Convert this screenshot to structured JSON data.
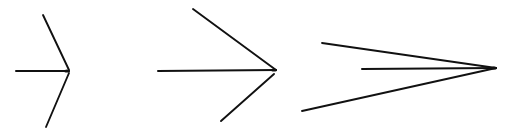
{
  "figure": {
    "stroke_color": "#111111",
    "background": "#ffffff",
    "arrows": [
      {
        "id": "arrow-1",
        "shaft": {
          "x1": 16,
          "y1": 71,
          "x2": 69,
          "y2": 71
        },
        "fin_upper": {
          "x1": 43,
          "y1": 15,
          "x2": 69,
          "y2": 70
        },
        "fin_lower": {
          "x1": 69,
          "y1": 73,
          "x2": 46,
          "y2": 127
        },
        "tip": {
          "x": 69,
          "y": 71
        }
      },
      {
        "id": "arrow-2",
        "shaft": {
          "x1": 158,
          "y1": 71,
          "x2": 276,
          "y2": 70
        },
        "fin_upper": {
          "x1": 193,
          "y1": 9,
          "x2": 276,
          "y2": 70
        },
        "fin_lower": {
          "x1": 274,
          "y1": 74,
          "x2": 221,
          "y2": 121
        },
        "tip": {
          "x": 276,
          "y": 70
        }
      },
      {
        "id": "arrow-3",
        "shaft": {
          "x1": 362,
          "y1": 69,
          "x2": 496,
          "y2": 68
        },
        "fin_upper": {
          "x1": 322,
          "y1": 43,
          "x2": 496,
          "y2": 68
        },
        "fin_lower": {
          "x1": 302,
          "y1": 111,
          "x2": 496,
          "y2": 68
        },
        "tip": {
          "x": 496,
          "y": 68
        }
      }
    ]
  }
}
